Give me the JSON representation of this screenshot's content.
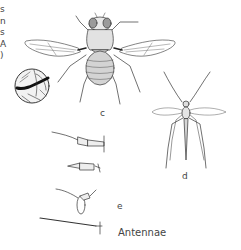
{
  "figure": {
    "edge_text_fragments": [
      "s",
      "n",
      "s",
      "A",
      ")"
    ],
    "labels": {
      "fly": "c",
      "mosquito": "d",
      "antennae_group": "e",
      "antennae_caption": "Antennae"
    },
    "illustrations": [
      {
        "name": "house-fly",
        "label": "c"
      },
      {
        "name": "wing-detail-inset",
        "label": ""
      },
      {
        "name": "mosquito",
        "label": "d"
      },
      {
        "name": "antennae-set",
        "label": "e",
        "count": 4
      }
    ]
  }
}
